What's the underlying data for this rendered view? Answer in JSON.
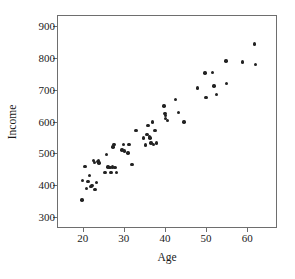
{
  "chart_data": {
    "type": "scatter",
    "title": "",
    "xlabel": "Age",
    "ylabel": "Income",
    "xlim": [
      14,
      67
    ],
    "ylim": [
      270,
      930
    ],
    "xticks": [
      20,
      30,
      40,
      50,
      60
    ],
    "yticks": [
      300,
      400,
      500,
      600,
      700,
      800,
      900
    ],
    "grid": false,
    "legend": null,
    "marker": "filled-circle",
    "marker_color": "#222222",
    "frame_color": "#6e6e6e",
    "background": "#ffffff",
    "n_points": 72,
    "points": [
      {
        "x": 19.8,
        "y": 355
      },
      {
        "x": 20.0,
        "y": 415
      },
      {
        "x": 20.6,
        "y": 459
      },
      {
        "x": 20.9,
        "y": 391
      },
      {
        "x": 21.3,
        "y": 412
      },
      {
        "x": 21.7,
        "y": 431
      },
      {
        "x": 22.0,
        "y": 397
      },
      {
        "x": 22.3,
        "y": 400
      },
      {
        "x": 22.6,
        "y": 478
      },
      {
        "x": 22.8,
        "y": 472
      },
      {
        "x": 23.0,
        "y": 388
      },
      {
        "x": 23.4,
        "y": 410
      },
      {
        "x": 23.6,
        "y": 474
      },
      {
        "x": 23.8,
        "y": 477
      },
      {
        "x": 24.0,
        "y": 470
      },
      {
        "x": 25.4,
        "y": 440
      },
      {
        "x": 25.8,
        "y": 496
      },
      {
        "x": 26.2,
        "y": 458
      },
      {
        "x": 26.6,
        "y": 457
      },
      {
        "x": 26.9,
        "y": 440
      },
      {
        "x": 27.2,
        "y": 458
      },
      {
        "x": 27.4,
        "y": 520
      },
      {
        "x": 27.6,
        "y": 528
      },
      {
        "x": 27.9,
        "y": 457
      },
      {
        "x": 28.2,
        "y": 441
      },
      {
        "x": 29.6,
        "y": 511
      },
      {
        "x": 29.9,
        "y": 528
      },
      {
        "x": 30.2,
        "y": 508
      },
      {
        "x": 31.0,
        "y": 502
      },
      {
        "x": 31.3,
        "y": 528
      },
      {
        "x": 32.0,
        "y": 465
      },
      {
        "x": 33.0,
        "y": 571
      },
      {
        "x": 34.8,
        "y": 549
      },
      {
        "x": 35.2,
        "y": 526
      },
      {
        "x": 35.6,
        "y": 560
      },
      {
        "x": 35.9,
        "y": 588
      },
      {
        "x": 36.2,
        "y": 553
      },
      {
        "x": 36.4,
        "y": 549
      },
      {
        "x": 36.6,
        "y": 533
      },
      {
        "x": 36.9,
        "y": 599
      },
      {
        "x": 37.2,
        "y": 528
      },
      {
        "x": 37.6,
        "y": 571
      },
      {
        "x": 38.0,
        "y": 533
      },
      {
        "x": 39.8,
        "y": 648
      },
      {
        "x": 40.0,
        "y": 626
      },
      {
        "x": 40.1,
        "y": 618
      },
      {
        "x": 40.2,
        "y": 610
      },
      {
        "x": 40.6,
        "y": 604
      },
      {
        "x": 42.6,
        "y": 668
      },
      {
        "x": 43.3,
        "y": 628
      },
      {
        "x": 44.6,
        "y": 599
      },
      {
        "x": 47.9,
        "y": 705
      },
      {
        "x": 49.7,
        "y": 752
      },
      {
        "x": 50.0,
        "y": 676
      },
      {
        "x": 51.6,
        "y": 754
      },
      {
        "x": 51.9,
        "y": 711
      },
      {
        "x": 52.6,
        "y": 685
      },
      {
        "x": 54.8,
        "y": 789
      },
      {
        "x": 55.0,
        "y": 719
      },
      {
        "x": 58.8,
        "y": 786
      },
      {
        "x": 61.8,
        "y": 843
      },
      {
        "x": 62.0,
        "y": 779
      }
    ]
  }
}
